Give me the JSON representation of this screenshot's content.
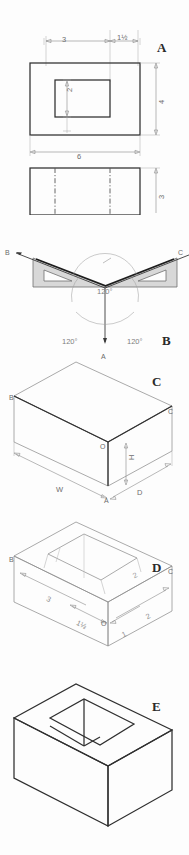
{
  "sheet": {
    "title": "Isometric Drawing Construction Plate",
    "background": "#fdfdfd",
    "line_color": "#2f2f2f",
    "dim_color": "#8a8a8a",
    "triangle_fill": "#d8d8d8"
  },
  "panels": [
    {
      "letter": "A",
      "name": "orthographic-views",
      "caption": "A",
      "description": "Top view and front view of block with rectangular hole",
      "dimensions": {
        "top_left_offset": "3",
        "top_right_offset": "1½",
        "hole_height": "2",
        "overall_height": "4",
        "overall_width": "6",
        "front_height": "3"
      }
    },
    {
      "letter": "B",
      "name": "isometric-axes-setup",
      "caption": "B",
      "description": "Two 30-60-90 triangles establishing isometric axes at 120 degrees",
      "angles": [
        "120°",
        "120°",
        "120°"
      ],
      "axis_labels": {
        "left": "B",
        "right": "C",
        "down": "A"
      }
    },
    {
      "letter": "C",
      "name": "isometric-enclosing-box",
      "caption": "C",
      "description": "Isometric enclosing box blocked in from the three axes",
      "vertex_labels": {
        "origin": "O",
        "left": "B",
        "right": "C",
        "bottom": "A"
      },
      "dimensions": {
        "width": "W",
        "depth": "D",
        "height": "H"
      }
    },
    {
      "letter": "D",
      "name": "isometric-layout-measurements",
      "caption": "D",
      "description": "Laying off measurements along isometric axes for the hole",
      "vertex_labels": {
        "origin": "O",
        "left": "B",
        "right": "C",
        "bottom": "A"
      },
      "dimensions": {
        "left_long": "3",
        "left_short": "1½",
        "right_long": "2",
        "right_short": "1",
        "depth_mark": "2"
      }
    },
    {
      "letter": "E",
      "name": "finished-isometric",
      "caption": "E",
      "description": "Finished isometric drawing of block with rectangular through hole"
    }
  ]
}
